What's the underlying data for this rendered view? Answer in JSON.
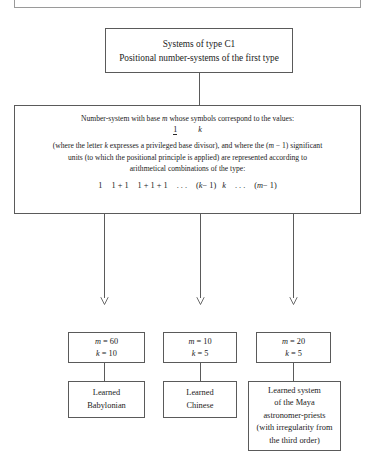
{
  "page": {
    "background_color": "#ffffff",
    "line_color": "#5a5a5a",
    "text_color": "#1b1b1b"
  },
  "clipped_top": {
    "fragment_text": "g"
  },
  "diagram": {
    "type": "flowchart",
    "root": {
      "title_line_1": "Systems of type C1",
      "title_line_2": "Positional number-systems of the first type"
    },
    "definition": {
      "line_1": "Number-system with base m whose symbols correspond to the values:",
      "line_1_prefix": "Number-system with base ",
      "line_1_symbol": "m",
      "line_1_suffix": " whose symbols correspond to the values:",
      "symbols": {
        "first": "1",
        "second": "k"
      },
      "line_2_a": "(where the letter ",
      "line_2_sym_k": "k",
      "line_2_b": " expresses a privileged base divisor), and where the (",
      "line_2_sym_m": "m",
      "line_2_c": " − 1) significant",
      "line_3": "units (to which the positional principle is applied) are represented according to",
      "line_4": "arithmetical combinations of the type:",
      "formula": {
        "term_1": "1",
        "term_2": "1 + 1",
        "term_3": "1 + 1 + 1",
        "ellipsis_1": ". . .",
        "term_4_open": "(",
        "term_4_sym": "k",
        "term_4_close": " − 1)",
        "term_5": "k",
        "ellipsis_2": ". . .",
        "term_6_open": "(",
        "term_6_sym": "m",
        "term_6_close": " − 1)"
      }
    },
    "branches": [
      {
        "id": "babylonian",
        "params": {
          "m_label": "m",
          "m_value": "= 60",
          "k_label": "k",
          "k_value": "= 10",
          "m_line": "m = 60",
          "k_line": "k = 10"
        },
        "result": {
          "line_1": "Learned",
          "line_2": "Babylonian"
        }
      },
      {
        "id": "chinese",
        "params": {
          "m_label": "m",
          "m_value": "= 10",
          "k_label": "k",
          "k_value": "= 5",
          "m_line": "m = 10",
          "k_line": "k = 5"
        },
        "result": {
          "line_1": "Learned",
          "line_2": "Chinese"
        }
      },
      {
        "id": "maya",
        "params": {
          "m_label": "m",
          "m_value": "= 20",
          "k_label": "k",
          "k_value": "= 5",
          "m_line": "m = 20",
          "k_line": "k = 5"
        },
        "result": {
          "line_1": "Learned system",
          "line_2": "of the Maya",
          "line_3": "astronomer-priests",
          "line_4": "(with irregularity from",
          "line_5": "the third order)"
        }
      }
    ]
  }
}
